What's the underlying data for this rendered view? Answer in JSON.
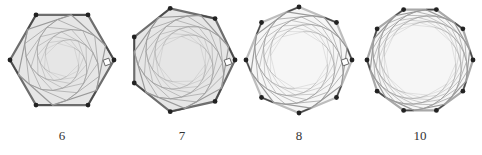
{
  "figures": [
    {
      "n": 6,
      "label": "6",
      "cx": 62,
      "cy": 60,
      "r": 52,
      "rot": 0,
      "style": "filled",
      "right_angle": true
    },
    {
      "n": 7,
      "label": "7",
      "cx": 182,
      "cy": 60,
      "r": 53,
      "rot": 0,
      "style": "filled",
      "right_angle": true
    },
    {
      "n": 8,
      "label": "8",
      "cx": 299,
      "cy": 60,
      "r": 53,
      "rot": 0,
      "style": "light",
      "right_angle": true
    },
    {
      "n": 10,
      "label": "10",
      "cx": 420,
      "cy": 60,
      "r": 53,
      "rot": 0,
      "style": "medium",
      "right_angle": false
    }
  ],
  "labels": {
    "f0": "6",
    "f1": "7",
    "f2": "8",
    "f3": "10"
  },
  "colors": {
    "fill": "#e6e6e6",
    "outer_dark": "#6e6e6e",
    "outer_light": "#bdbdbd",
    "spoke": "#4a4a4a",
    "inner": "#9a9a9a",
    "vertex": "#222222"
  }
}
